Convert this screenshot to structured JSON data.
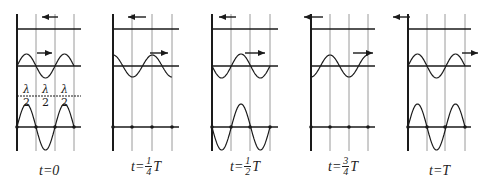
{
  "figure": {
    "colors": {
      "line": "#1a1a1a",
      "grid": "#9a9a9a"
    },
    "panels": [
      {
        "id": "p0",
        "label": {
          "prefix": "t=",
          "value": "0",
          "frac": null,
          "suffix": ""
        },
        "x0": 17,
        "grid": [
          36,
          55,
          74
        ],
        "xend": 81,
        "top_arrow": {
          "dir": "left",
          "x1": 58,
          "x2": 42
        },
        "mid_wave": {
          "phase": 0,
          "amp": 12
        },
        "mid_arrow": {
          "dir": "right",
          "x1": 37,
          "x2": 52
        },
        "sum_amp": 23,
        "sum_phase": 0,
        "half_wavelength_marks": true
      },
      {
        "id": "p1",
        "label": {
          "prefix": "t=",
          "value": "",
          "frac": {
            "num": "1",
            "den": "4"
          },
          "suffix": "T"
        },
        "x0": 113,
        "grid": [
          132,
          152,
          172
        ],
        "xend": 179,
        "top_arrow": {
          "dir": "left",
          "x1": 146,
          "x2": 128
        },
        "mid_wave": {
          "phase": 90,
          "amp": 11
        },
        "mid_arrow": {
          "dir": "right",
          "x1": 150,
          "x2": 168
        },
        "sum_amp": 0,
        "sum_phase": 0,
        "half_wavelength_marks": false
      },
      {
        "id": "p2",
        "label": {
          "prefix": "t=",
          "value": "",
          "frac": {
            "num": "1",
            "den": "2"
          },
          "suffix": "T"
        },
        "x0": 212,
        "grid": [
          231,
          250,
          270
        ],
        "xend": 278,
        "top_arrow": {
          "dir": "left",
          "x1": 236,
          "x2": 219
        },
        "mid_wave": {
          "phase": 180,
          "amp": 12
        },
        "mid_arrow": {
          "dir": "right",
          "x1": 245,
          "x2": 265
        },
        "sum_amp": 23,
        "sum_phase": 180,
        "half_wavelength_marks": false
      },
      {
        "id": "p3",
        "label": {
          "prefix": "t=",
          "value": "",
          "frac": {
            "num": "3",
            "den": "4"
          },
          "suffix": "T"
        },
        "x0": 311,
        "grid": [
          330,
          349,
          368
        ],
        "xend": 375,
        "top_arrow": {
          "dir": "left",
          "x1": 323,
          "x2": 304
        },
        "mid_wave": {
          "phase": 270,
          "amp": 11
        },
        "mid_arrow": {
          "dir": "right",
          "x1": 353,
          "x2": 373
        },
        "sum_amp": 0,
        "sum_phase": 0,
        "half_wavelength_marks": false
      },
      {
        "id": "p4",
        "label": {
          "prefix": "t=",
          "value": "T",
          "frac": null,
          "suffix": ""
        },
        "x0": 408,
        "grid": [
          427,
          445,
          465
        ],
        "xend": 471,
        "top_arrow": {
          "dir": "left",
          "x1": 410,
          "x2": 393
        },
        "mid_wave": {
          "phase": 0,
          "amp": 12
        },
        "mid_arrow": {
          "dir": "right",
          "x1": 462,
          "x2": 478
        },
        "sum_amp": 23,
        "sum_phase": 0,
        "half_wavelength_marks": false
      }
    ],
    "rows": {
      "top_y": 29,
      "mid_y": 66,
      "marks_y": 96,
      "axis_y": 127,
      "grid_top": 14,
      "grid_bottom": 151
    },
    "half_wavelength_label": {
      "num": "λ",
      "den": "2"
    },
    "extra_arrow_tip": {
      "x": 396,
      "y": 20
    }
  }
}
